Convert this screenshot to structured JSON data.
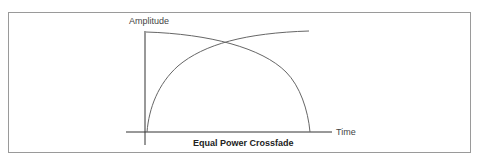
{
  "diagram": {
    "title": "Equal Power Crossfade",
    "y_axis_label": "Amplitude",
    "x_axis_label": "Time",
    "curves": [
      {
        "name": "fade-out",
        "description": "starts at full amplitude, falls to zero following a cosine curve"
      },
      {
        "name": "fade-in",
        "description": "starts at zero, rises to full amplitude following a sine curve"
      }
    ],
    "colors": {
      "frame": "#9a9a9a",
      "axis": "#333333",
      "curve": "#666666"
    }
  }
}
